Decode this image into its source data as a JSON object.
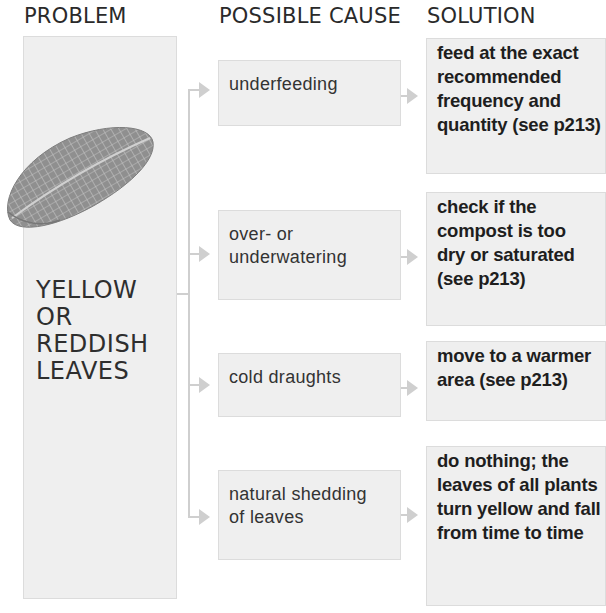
{
  "headers": {
    "problem": "PROBLEM",
    "cause": "POSSIBLE CAUSE",
    "solution": "SOLUTION"
  },
  "problem": {
    "lines": [
      "YELLOW",
      "OR",
      "REDDISH",
      "LEAVES"
    ],
    "icon": "leaf-illustration"
  },
  "rows": [
    {
      "cause": [
        "underfeeding"
      ],
      "solution": [
        "feed at the exact",
        "recommended",
        "frequency and",
        "quantity (see p213)"
      ]
    },
    {
      "cause": [
        "over- or",
        "underwatering"
      ],
      "solution": [
        "check if the",
        "compost is too",
        "dry or saturated",
        "(see p213)"
      ]
    },
    {
      "cause": [
        "cold draughts"
      ],
      "solution": [
        "move to a warmer",
        "area (see p213)"
      ]
    },
    {
      "cause": [
        "natural shedding",
        "of leaves"
      ],
      "solution": [
        "do nothing; the",
        "leaves of all plants",
        "turn yellow and fall",
        "from time to time"
      ]
    }
  ],
  "colors": {
    "box_fill": "#efefef",
    "box_border": "#dcdcdc",
    "connector": "#cfcfcf",
    "text": "#222222"
  }
}
